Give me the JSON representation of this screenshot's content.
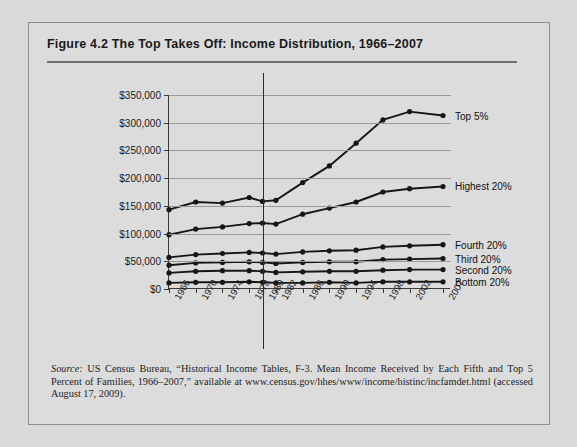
{
  "figure": {
    "title": "Figure 4.2  The Top Takes Off: Income Distribution, 1966–2007",
    "source_italic": "Source:",
    "source_text": " US Census Bureau, “Historical Income Tables, F-3. Mean Income Received by Each Fifth and Top 5 Percent of Families, 1966–2007,” available at www.census.gov/hhes/www/income/histinc/incfamdet.html (accessed August 17, 2009)."
  },
  "chart_data": {
    "type": "line",
    "title": "The Top Takes Off: Income Distribution, 1966–2007",
    "xlabel": "",
    "ylabel": "",
    "ylim": [
      0,
      350000
    ],
    "yticks": [
      0,
      50000,
      100000,
      150000,
      200000,
      250000,
      300000,
      350000
    ],
    "ytick_labels": [
      "$0",
      "$50,000",
      "$100,000",
      "$150,000",
      "$200,000",
      "$250,000",
      "$300,000",
      "$350,000"
    ],
    "grid": true,
    "legend": "right-inline-labels",
    "categories": [
      "1966",
      "1970",
      "1974",
      "1978",
      "1980",
      "1982",
      "1986",
      "1990",
      "1994",
      "1998",
      "2002",
      "2007"
    ],
    "annotation_vline": "1980",
    "series": [
      {
        "name": "Top 5%",
        "values": [
          143000,
          157000,
          155000,
          165000,
          158000,
          160000,
          192000,
          222000,
          263000,
          305000,
          320000,
          313000
        ]
      },
      {
        "name": "Highest 20%",
        "values": [
          98000,
          108000,
          112000,
          118000,
          119000,
          117000,
          135000,
          146000,
          157000,
          175000,
          181000,
          185000
        ]
      },
      {
        "name": "Fourth 20%",
        "values": [
          57000,
          62000,
          64000,
          66000,
          65000,
          63000,
          67000,
          69000,
          70000,
          76000,
          78000,
          80000
        ]
      },
      {
        "name": "Third 20%",
        "values": [
          43000,
          47000,
          48000,
          49000,
          48000,
          46000,
          48000,
          49000,
          49000,
          53000,
          54000,
          55000
        ]
      },
      {
        "name": "Second 20%",
        "values": [
          29000,
          32000,
          33000,
          33000,
          32000,
          30000,
          31000,
          32000,
          32000,
          34000,
          35000,
          35000
        ]
      },
      {
        "name": "Bottom 20%",
        "values": [
          11000,
          12000,
          12000,
          13000,
          12000,
          11000,
          11000,
          12000,
          11000,
          13000,
          13000,
          13000
        ]
      }
    ]
  }
}
